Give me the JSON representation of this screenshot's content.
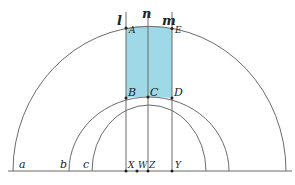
{
  "figure": {
    "colors": {
      "line": "#6b6b6b",
      "shade": "#9fd8e6",
      "point": "#222222"
    },
    "labels": {
      "l": "l",
      "n": "n",
      "m": "m",
      "A": "A",
      "E": "E",
      "B": "B",
      "C": "C",
      "D": "D",
      "a": "a",
      "b": "b",
      "c": "c",
      "X": "X",
      "W": "W",
      "Z": "Z",
      "Y": "Y"
    }
  }
}
